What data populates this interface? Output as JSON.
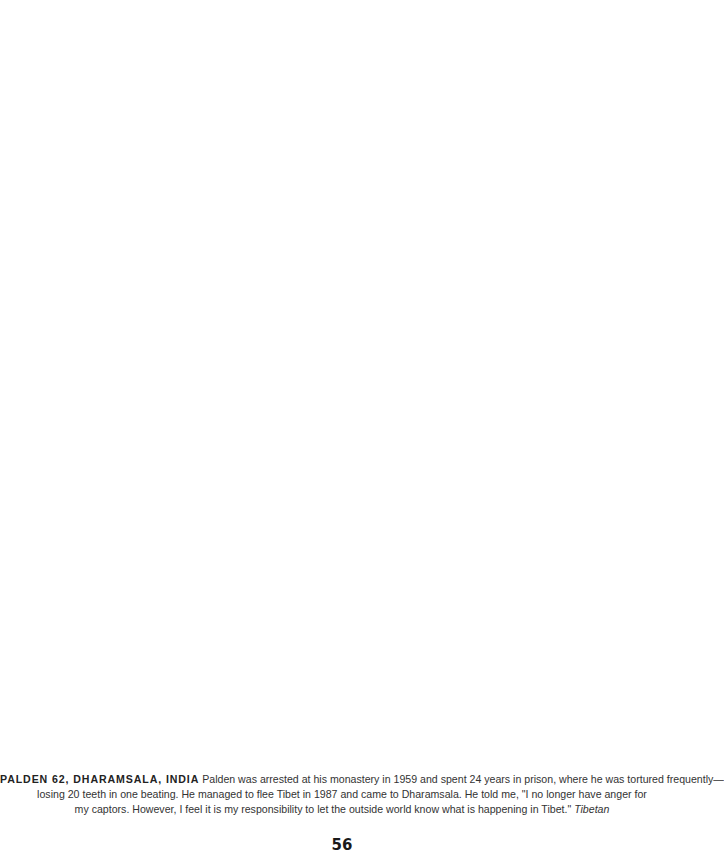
{
  "caption": {
    "lead": "PALDEN 62, DHARAMSALA, INDIA",
    "line1_text": " Palden was arrested at his monastery in 1959 and spent 24 years in prison, where he was tortured frequently—",
    "line2_text": "losing 20 teeth in one beating. He managed to flee Tibet in 1987 and came to Dharamsala. He told me, \"I no longer have anger for",
    "line3_text": "my captors. However, I feel it is my responsibility to let the outside world know what is happening in Tibet.\" ",
    "credit": "Tibetan"
  },
  "page_number": "56"
}
